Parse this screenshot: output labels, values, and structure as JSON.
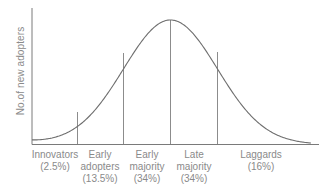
{
  "chart_data": {
    "type": "line",
    "title": "",
    "subtitle": "Diffusion of innovations adopter categories (bell curve)",
    "xlabel": "",
    "ylabel": "No.of new adopters",
    "grid": false,
    "legend": null,
    "curve": "normal distribution (bell curve), peak at center",
    "categories": [
      {
        "name": "Innovators",
        "share": "(2.5%)",
        "lines": [
          "Innovators",
          "(2.5%)"
        ],
        "value": 2.5
      },
      {
        "name": "Early adopters",
        "share": "(13.5%)",
        "lines": [
          "Early",
          "adopters",
          "(13.5%)"
        ],
        "value": 13.5
      },
      {
        "name": "Early majority",
        "share": "(34%)",
        "lines": [
          "Early",
          "majority",
          "(34%)"
        ],
        "value": 34
      },
      {
        "name": "Late majority",
        "share": "(34%)",
        "lines": [
          "Late",
          "majority",
          "(34%)"
        ],
        "value": 34
      },
      {
        "name": "Laggards",
        "share": "(16%)",
        "lines": [
          "Laggards",
          "(16%)"
        ],
        "value": 16
      }
    ],
    "dividers_in_std_dev": [
      -2,
      -1,
      0,
      1
    ],
    "colors": {
      "axis": "#7a7a7a",
      "curve": "#6e6e6e",
      "divider": "#8c8c8c",
      "text": "#8a8a8a"
    }
  }
}
